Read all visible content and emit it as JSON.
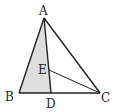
{
  "figure": {
    "type": "triangle-diagram",
    "points": {
      "A": {
        "label": "A"
      },
      "B": {
        "label": "B"
      },
      "C": {
        "label": "C"
      },
      "D": {
        "label": "D"
      },
      "E": {
        "label": "E"
      }
    },
    "segments": [
      "AB",
      "AC",
      "BC",
      "AD",
      "EC"
    ],
    "shaded_region": "ABD",
    "colors": {
      "stroke": "#222222",
      "shade": "#dedede"
    }
  }
}
